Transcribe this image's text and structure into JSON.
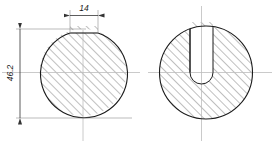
{
  "drawing": {
    "type": "engineering-drawing",
    "title": "",
    "background_color": "#ffffff",
    "outline_color": "#1a1a1a",
    "hatch_color": "#555555",
    "centerline_color": "#b9b9b9",
    "dimension_color": "#5a5a5a",
    "dimensions": {
      "width_label": "14",
      "height_label": "46.2"
    },
    "views": {
      "left": {
        "name": "front-section-view",
        "center_x": 83,
        "center_y": 72.5,
        "radius": 43.5,
        "keyway_left_x": 70,
        "keyway_right_x": 98,
        "keyway_top_y": 33
      },
      "right": {
        "name": "side-section-view",
        "center_x": 206,
        "center_y": 72.5,
        "radius": 46.5,
        "slot_left_x": 190,
        "slot_right_x": 213,
        "slot_bottom_y": 72.5,
        "slot_round_radius": 11.5
      }
    }
  }
}
